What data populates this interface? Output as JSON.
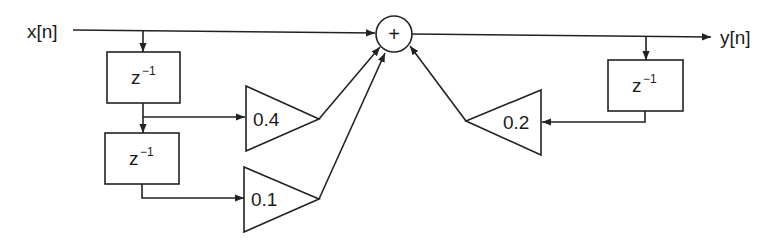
{
  "diagram": {
    "type": "IIR filter block diagram",
    "input_label": "x[n]",
    "output_label": "y[n]",
    "adder_symbol": "+",
    "delay_blocks": [
      {
        "id": "delay-x1",
        "base": "z",
        "exponent": "−1"
      },
      {
        "id": "delay-x2",
        "base": "z",
        "exponent": "−1"
      },
      {
        "id": "delay-y1",
        "base": "z",
        "exponent": "−1"
      }
    ],
    "gains": [
      {
        "id": "gain-x1",
        "value": "0.4"
      },
      {
        "id": "gain-x2",
        "value": "0.1"
      },
      {
        "id": "gain-y1",
        "value": "0.2"
      }
    ]
  }
}
